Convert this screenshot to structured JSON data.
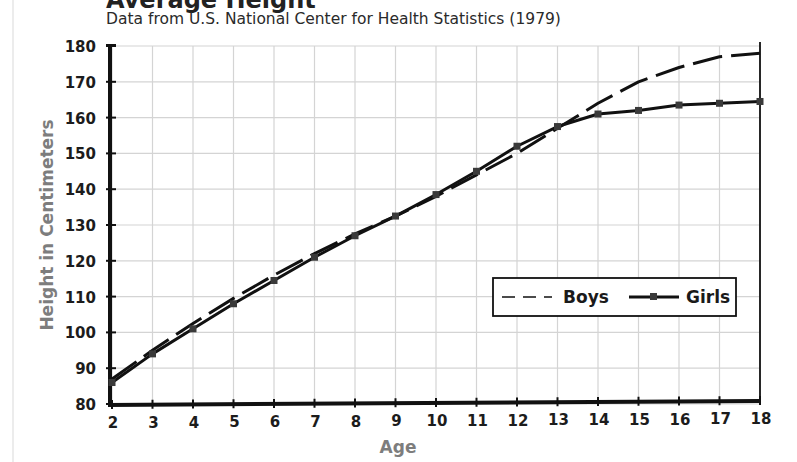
{
  "title": "Average Height",
  "subtitle": "Data from U.S. National Center for Health Statistics (1979)",
  "legend": {
    "boys_label": "Boys",
    "girls_label": "Girls"
  },
  "colors": {
    "line": "#111111",
    "marker": "#3a3a3a",
    "grid": "#d4d4d4",
    "axis_title": "#7d7d7d"
  },
  "chart_data": {
    "type": "line",
    "title": "Average Height",
    "subtitle": "Data from U.S. National Center for Health Statistics (1979)",
    "xlabel": "Age",
    "ylabel": "Height in Centimeters",
    "x": [
      2,
      3,
      4,
      5,
      6,
      7,
      8,
      9,
      10,
      11,
      12,
      13,
      14,
      15,
      16,
      17,
      18
    ],
    "xlim": [
      2,
      18
    ],
    "ylim": [
      80,
      180
    ],
    "x_ticks": [
      "2",
      "3",
      "4",
      "5",
      "6",
      "7",
      "8",
      "9",
      "10",
      "11",
      "12",
      "13",
      "14",
      "15",
      "16",
      "17",
      "18"
    ],
    "y_ticks": [
      "80",
      "90",
      "100",
      "110",
      "120",
      "130",
      "140",
      "150",
      "160",
      "170",
      "180"
    ],
    "grid": true,
    "legend_position": "lower right (inside plot)",
    "series": [
      {
        "name": "Boys",
        "style": "dashed, no markers",
        "values": [
          87,
          95,
          102.5,
          109.5,
          116,
          122,
          127.5,
          132.5,
          138,
          144,
          150,
          157,
          164,
          170,
          174,
          177,
          178
        ]
      },
      {
        "name": "Girls",
        "style": "solid with square markers",
        "values": [
          86,
          94,
          101,
          108,
          114.5,
          121,
          127,
          132.5,
          138.5,
          145,
          152,
          157.5,
          161,
          162,
          163.5,
          164,
          164.5
        ]
      }
    ]
  }
}
